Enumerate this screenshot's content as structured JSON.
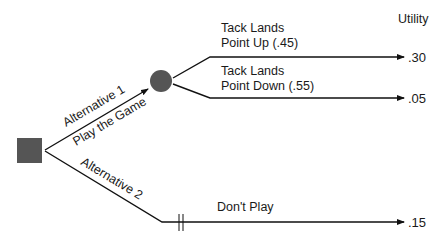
{
  "diagram": {
    "type": "decision-tree",
    "utility_header": "Utility",
    "decision_node": {
      "shape": "square",
      "color": "#555555"
    },
    "chance_node": {
      "shape": "circle",
      "color": "#555555"
    },
    "alternatives": [
      {
        "label": "Alternative 1",
        "sublabel": "Play the Game",
        "outcomes": [
          {
            "label_line1": "Tack Lands",
            "label_line2": "Point Up (.45)",
            "probability": ".45",
            "utility": ".30"
          },
          {
            "label_line1": "Tack Lands",
            "label_line2": "Point Down (.55)",
            "probability": ".55",
            "utility": ".05"
          }
        ]
      },
      {
        "label": "Alternative 2",
        "outcome_label": "Don't Play",
        "utility": ".15",
        "pruned": true
      }
    ],
    "line_color": "#111111"
  }
}
